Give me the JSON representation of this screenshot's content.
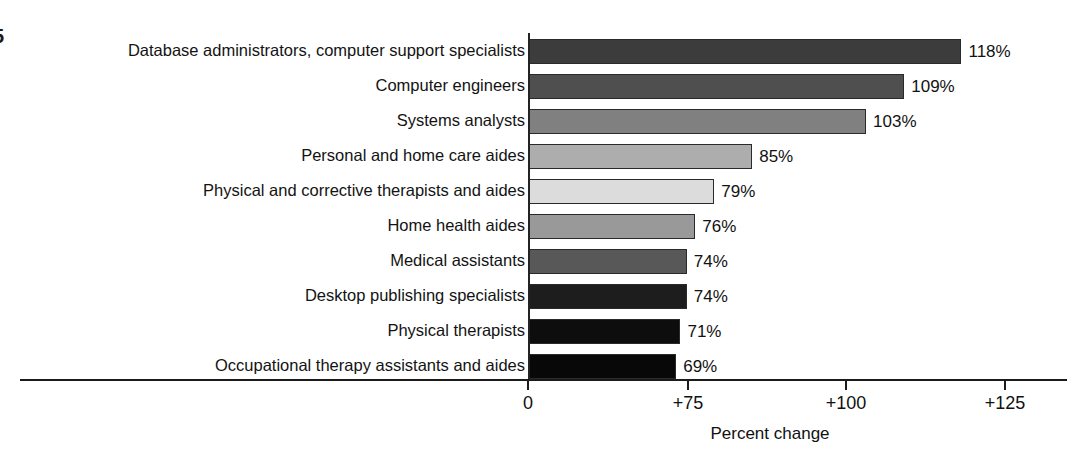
{
  "chart_data": {
    "type": "bar",
    "orientation": "horizontal",
    "title": "",
    "xlabel": "Percent change",
    "ylabel": "",
    "grid": false,
    "legend": false,
    "categories": [
      "Database administrators, computer support specialists",
      "Computer engineers",
      "Systems analysts",
      "Personal and home care aides",
      "Physical and corrective therapists and aides",
      "Home health aides",
      "Medical assistants",
      "Desktop publishing specialists",
      "Physical therapists",
      "Occupational therapy assistants and aides"
    ],
    "values": [
      118,
      109,
      103,
      85,
      79,
      76,
      74,
      74,
      71,
      69
    ],
    "value_labels": [
      "118%",
      "109%",
      "103%",
      "85%",
      "79%",
      "76%",
      "74%",
      "74%",
      "71%",
      "69%"
    ],
    "bar_colors": [
      "#3c3c3c",
      "#4f4f4f",
      "#808080",
      "#adadad",
      "#dcdcdc",
      "#999999",
      "#585858",
      "#1d1d1d",
      "#0d0d0d",
      "#080808"
    ],
    "axis_ticks": [
      {
        "label": "0",
        "value": 0
      },
      {
        "label": "+75",
        "value": 75
      },
      {
        "label": "+100",
        "value": 100
      },
      {
        "label": "+125",
        "value": 125
      }
    ],
    "axis_note": "axis is broken between 0 and +75"
  },
  "edge_fragments": {
    "top": "5",
    "middle": "."
  }
}
